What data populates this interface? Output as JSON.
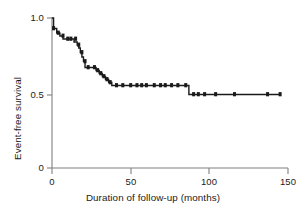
{
  "figure": {
    "background": "#ffffff",
    "axis_color": "#808080",
    "curve_color": "#1a1a1a",
    "mark_color": "#1a1a1a"
  },
  "axes": {
    "x_title": "Duration of follow-up (months)",
    "y_title": "Event-free survival",
    "x_ticks": [
      "0",
      "50",
      "100",
      "150"
    ],
    "y_ticks": [
      "1.0",
      "0.5",
      "0"
    ]
  },
  "chart_data": {
    "type": "line",
    "title": "",
    "subtitle": "",
    "xlabel": "Duration of follow-up (months)",
    "ylabel": "Event-free survival",
    "xlim": [
      0,
      150
    ],
    "ylim": [
      0,
      1.0
    ],
    "xticks": [
      0,
      50,
      100,
      150
    ],
    "yticks": [
      0,
      0.5,
      1.0
    ],
    "grid": false,
    "legend": "none",
    "step_style": "post",
    "series": [
      {
        "name": "Event-free survival",
        "x": [
          0,
          1,
          1,
          3,
          3,
          5,
          5,
          7,
          7,
          9,
          9,
          11,
          11,
          14,
          14,
          16,
          16,
          17,
          17,
          18,
          18,
          19,
          19,
          20,
          20,
          21,
          21,
          26,
          26,
          28,
          28,
          30,
          30,
          32,
          32,
          34,
          34,
          36,
          36,
          38,
          38,
          39,
          39,
          87,
          87,
          145
        ],
        "y": [
          1.0,
          1.0,
          0.93,
          0.93,
          0.9,
          0.9,
          0.88,
          0.88,
          0.86,
          0.86,
          0.86,
          0.86,
          0.86,
          0.86,
          0.84,
          0.84,
          0.82,
          0.82,
          0.8,
          0.8,
          0.77,
          0.77,
          0.74,
          0.74,
          0.71,
          0.71,
          0.67,
          0.67,
          0.67,
          0.67,
          0.65,
          0.65,
          0.63,
          0.63,
          0.61,
          0.61,
          0.59,
          0.59,
          0.57,
          0.57,
          0.55,
          0.55,
          0.55,
          0.55,
          0.49,
          0.49
        ]
      }
    ],
    "censor_marks": {
      "description": "tick marks on the survival curve indicating censored observations",
      "x": [
        1,
        4,
        7,
        10,
        12,
        15,
        17,
        19,
        21,
        23,
        27,
        29,
        31,
        33,
        35,
        37,
        41,
        45,
        50,
        54,
        57,
        60,
        65,
        69,
        72,
        76,
        80,
        85,
        90,
        93,
        97,
        104,
        116,
        137,
        145
      ],
      "y": [
        0.93,
        0.9,
        0.88,
        0.86,
        0.86,
        0.86,
        0.82,
        0.77,
        0.71,
        0.67,
        0.67,
        0.65,
        0.63,
        0.61,
        0.59,
        0.57,
        0.55,
        0.55,
        0.55,
        0.55,
        0.55,
        0.55,
        0.55,
        0.55,
        0.55,
        0.55,
        0.55,
        0.55,
        0.49,
        0.49,
        0.49,
        0.49,
        0.49,
        0.49,
        0.49
      ]
    },
    "annotations": [
      {
        "text": "Initial steep decline over first ~40 months",
        "value": null
      },
      {
        "text": "Plateau at approximately 0.55 between 40 and 87 months",
        "value": 0.55
      },
      {
        "text": "Final plateau at approximately 0.49 after 87 months",
        "value": 0.49
      }
    ]
  }
}
